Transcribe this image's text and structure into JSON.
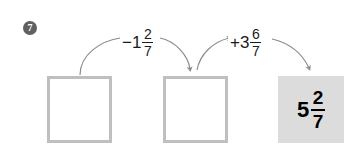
{
  "problem": {
    "number": "7",
    "badge_color": "#606060",
    "type": "number-line-flow-diagram"
  },
  "boxes": [
    {
      "name": "start-box",
      "value": "",
      "filled": false,
      "shaded": false
    },
    {
      "name": "intermediate-box",
      "value": "",
      "filled": false,
      "shaded": false
    },
    {
      "name": "result-box",
      "filled": true,
      "shaded": true,
      "sign": "",
      "whole": "5",
      "numerator": "2",
      "denominator": "7",
      "background": "#dcdcdc"
    }
  ],
  "operations": [
    {
      "name": "operation-subtract",
      "sign": "−",
      "whole": "1",
      "numerator": "2",
      "denominator": "7"
    },
    {
      "name": "operation-add",
      "sign": "+",
      "whole": "3",
      "numerator": "6",
      "denominator": "7"
    }
  ],
  "colors": {
    "box_border": "#bfbfbf",
    "shaded_fill": "#dcdcdc",
    "arrow": "#8c8c8c",
    "text": "#1a1a1a"
  }
}
